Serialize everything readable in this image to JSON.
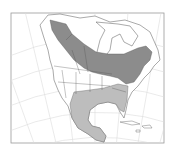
{
  "map": {
    "type": "species range map",
    "region": "North America",
    "projection": "conic (graticule lines shown)",
    "colors": {
      "background": "#ffffff",
      "frame": "#9a9a9a",
      "graticule": "#dcdcdc",
      "land_outline": "#555555",
      "range_dark": "#8c8c8c",
      "range_light": "#bdbdbd"
    },
    "legend": [
      {
        "name": "range-dark",
        "meaning": "breeding/summer range (dark gray)"
      },
      {
        "name": "range-light",
        "meaning": "winter range (light gray)"
      }
    ]
  }
}
